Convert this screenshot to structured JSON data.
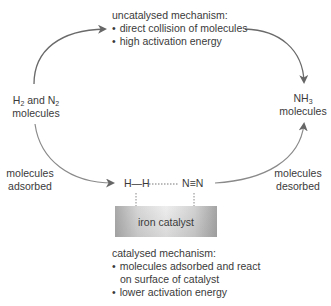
{
  "diagram": {
    "type": "reaction-mechanism",
    "uncatalysed": {
      "heading": "uncatalysed mechanism:",
      "bullets": [
        "direct collision of molecules",
        "high activation energy"
      ]
    },
    "reactants": {
      "line1_a": "H",
      "line1_sub1": "2",
      "line1_b": " and N",
      "line1_sub2": "2",
      "line2": "molecules"
    },
    "products": {
      "line1": "NH",
      "line1_sub": "3",
      "line2": "molecules"
    },
    "adsorbed_label": {
      "line1": "molecules",
      "line2": "adsorbed"
    },
    "desorbed_label": {
      "line1": "molecules",
      "line2": "desorbed"
    },
    "molecules_on_surface": {
      "hydrogen": "H—H",
      "nitrogen": "N≡N"
    },
    "catalyst": {
      "label": "iron catalyst"
    },
    "catalysed": {
      "heading": "catalysed mechanism:",
      "bullets": [
        "molecules adsorbed and react",
        "lower activation energy"
      ],
      "bullet1_continuation": "on surface of catalyst"
    },
    "colors": {
      "arrow": "#666666",
      "text": "#3a3a3a",
      "catalyst_dark": "#a4a4a4",
      "catalyst_light": "#eeeeee"
    }
  }
}
